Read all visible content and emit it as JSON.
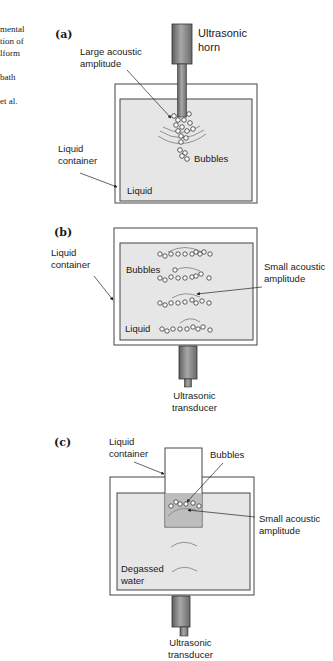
{
  "margin_text": {
    "lines": [
      "mental",
      "tion of",
      "lform",
      "",
      " bath",
      "",
      " et al."
    ]
  },
  "panels": {
    "a": {
      "letter": "(a)",
      "horn_label_line1": "Ultrasonic",
      "horn_label_line2": "horn",
      "amplitude_label_line1": "Large acoustic",
      "amplitude_label_line2": "amplitude",
      "container_label_line1": "Liquid",
      "container_label_line2": "container",
      "bubbles_label": "Bubbles",
      "liquid_label": "Liquid"
    },
    "b": {
      "letter": "(b)",
      "container_label_line1": "Liquid",
      "container_label_line2": "container",
      "bubbles_label": "Bubbles",
      "amplitude_label_line1": "Small acoustic",
      "amplitude_label_line2": "amplitude",
      "liquid_label": "Liquid",
      "transducer_label_line1": "Ultrasonic",
      "transducer_label_line2": "transducer"
    },
    "c": {
      "letter": "(c)",
      "container_label_line1": "Liquid",
      "container_label_line2": "container",
      "bubbles_label": "Bubbles",
      "amplitude_label_line1": "Small acoustic",
      "amplitude_label_line2": "amplitude",
      "water_label_line1": "Degassed",
      "water_label_line2": "water",
      "transducer_label_line1": "Ultrasonic",
      "transducer_label_line2": "transducer"
    }
  },
  "colors": {
    "liquid_fill": "#e6e6e6",
    "inner_container_fill": "#bdbdbd",
    "outline": "#333333",
    "device_dark": "#5a5a5a",
    "device_light": "#9a9a9a"
  }
}
